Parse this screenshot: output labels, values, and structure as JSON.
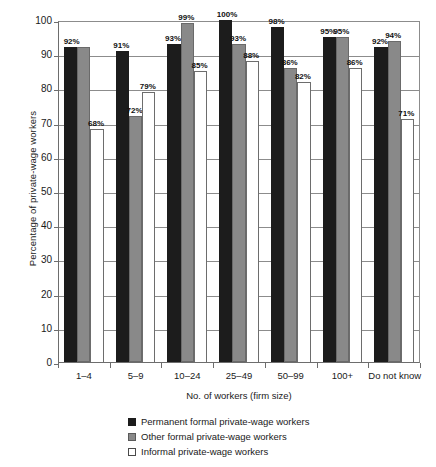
{
  "chart_data": {
    "type": "bar",
    "title": "",
    "xlabel": "No. of workers (firm size)",
    "ylabel": "Percentage of private-wage workers",
    "ylim": [
      0,
      100
    ],
    "ytick_labels": [
      "0",
      "10",
      "20",
      "30",
      "40",
      "50",
      "60",
      "70",
      "80",
      "90",
      "100"
    ],
    "ytick_values": [
      0,
      10,
      20,
      30,
      40,
      50,
      60,
      70,
      80,
      90,
      100
    ],
    "grid": true,
    "legend_position": "bottom-center",
    "categories": [
      "1–4",
      "5–9",
      "10–24",
      "25–49",
      "50–99",
      "100+",
      "Do not know"
    ],
    "series": [
      {
        "name": "Permanent formal private-wage workers",
        "color": "#1c1c1c",
        "values": [
          92,
          91,
          93,
          100,
          98,
          95,
          92
        ],
        "labels": [
          "92%",
          "91%",
          "93%",
          "100%",
          "98%",
          "95%",
          "92%"
        ]
      },
      {
        "name": "Other formal private-wage workers",
        "color": "#898989",
        "values": [
          92,
          72,
          99,
          93,
          86,
          95,
          94
        ],
        "labels": [
          "",
          "72%",
          "99%",
          "93%",
          "86%",
          "95%",
          "94%"
        ]
      },
      {
        "name": "Informal private-wage workers",
        "color": "#ffffff",
        "values": [
          68,
          79,
          85,
          88,
          82,
          86,
          71
        ],
        "labels": [
          "68%",
          "79%",
          "85%",
          "88%",
          "82%",
          "86%",
          "71%"
        ]
      }
    ],
    "shared_labels": [
      {
        "group": 0,
        "text": "92%",
        "note": "single label spanning dark and gray bars at 92%"
      }
    ]
  }
}
